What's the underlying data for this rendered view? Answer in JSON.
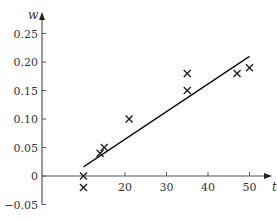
{
  "chart_data": {
    "type": "scatter",
    "title": "",
    "xlabel": "t",
    "ylabel": "w",
    "xlim": [
      0,
      52
    ],
    "ylim": [
      -0.05,
      0.28
    ],
    "grid": false,
    "legend": null,
    "x_ticks": [
      20,
      30,
      40,
      50
    ],
    "x_tick_labels": [
      "20",
      "30",
      "40",
      "50"
    ],
    "y_ticks": [
      0.25,
      0.2,
      0.15,
      0.1,
      0.05,
      0,
      -0.05
    ],
    "y_tick_labels": [
      "0.25",
      "0.20",
      "0.15",
      "0.10",
      "0.05",
      "0",
      "−0.05"
    ],
    "marker": "x",
    "series": [
      {
        "name": "data",
        "kind": "scatter",
        "points": [
          {
            "t": 10,
            "w": 0.0
          },
          {
            "t": 10,
            "w": -0.02
          },
          {
            "t": 14,
            "w": 0.04
          },
          {
            "t": 15,
            "w": 0.05
          },
          {
            "t": 21,
            "w": 0.1
          },
          {
            "t": 35,
            "w": 0.15
          },
          {
            "t": 35,
            "w": 0.18
          },
          {
            "t": 47,
            "w": 0.18
          },
          {
            "t": 50,
            "w": 0.19
          }
        ]
      },
      {
        "name": "fitted line",
        "kind": "line",
        "points": [
          {
            "t": 10,
            "w": 0.016
          },
          {
            "t": 50,
            "w": 0.21
          }
        ]
      }
    ]
  },
  "colors": {
    "axis": "#555555",
    "marker": "#222222",
    "line": "#111111",
    "text": "#333333"
  }
}
